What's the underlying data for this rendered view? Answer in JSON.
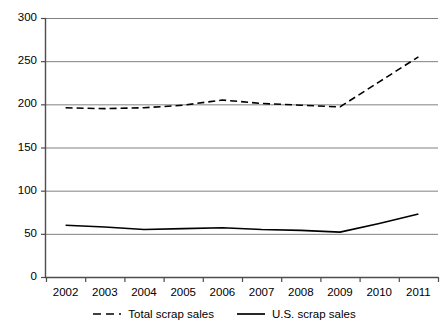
{
  "chart_data": {
    "type": "line",
    "title": "",
    "subtitle": "",
    "xlabel": "",
    "ylabel": "",
    "categories": [
      "2002",
      "2003",
      "2004",
      "2005",
      "2006",
      "2007",
      "2008",
      "2009",
      "2010",
      "2011"
    ],
    "x": [
      2002,
      2003,
      2004,
      2005,
      2006,
      2007,
      2008,
      2009,
      2010,
      2011
    ],
    "ylim": [
      0,
      300
    ],
    "yticks": [
      0,
      50,
      100,
      150,
      200,
      250,
      300
    ],
    "ytick_labels": [
      "0",
      "50",
      "100",
      "150",
      "200",
      "250",
      "300"
    ],
    "grid": true,
    "grid_axis": "y",
    "legend_position": "bottom",
    "series": [
      {
        "name": "Total scrap sales",
        "style": "dashed",
        "color": "#000000",
        "values": [
          196,
          195,
          196,
          199,
          205,
          201,
          199,
          197,
          226,
          255
        ]
      },
      {
        "name": "U.S. scrap sales",
        "style": "solid",
        "color": "#000000",
        "values": [
          60,
          58,
          55,
          56,
          57,
          55,
          54,
          52,
          62,
          73
        ]
      }
    ]
  },
  "legend": {
    "items": [
      {
        "label": "Total scrap sales",
        "style": "dashed"
      },
      {
        "label": "U.S. scrap sales",
        "style": "solid"
      }
    ]
  },
  "axes": {
    "y_tick_labels": [
      "300",
      "250",
      "200",
      "150",
      "100",
      "50",
      "0"
    ],
    "x_tick_labels": [
      "2002",
      "2003",
      "2004",
      "2005",
      "2006",
      "2007",
      "2008",
      "2009",
      "2010",
      "2011"
    ]
  },
  "colors": {
    "axis": "#4d4d4d",
    "grid": "#808080",
    "series": "#000000",
    "background": "#ffffff"
  }
}
